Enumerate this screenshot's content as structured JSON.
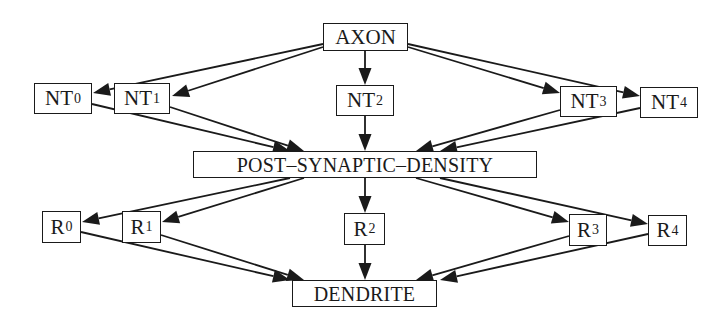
{
  "diagram": {
    "nodes": {
      "axon": {
        "label": "AXON",
        "x": 323,
        "y": 23,
        "w": 85,
        "h": 28
      },
      "nt0": {
        "label": "NT",
        "sub": "0",
        "x": 34,
        "y": 83,
        "w": 58,
        "h": 31
      },
      "nt1": {
        "label": "NT",
        "sub": "1",
        "x": 114,
        "y": 83,
        "w": 56,
        "h": 31
      },
      "nt2": {
        "label": "NT",
        "sub": "2",
        "x": 336,
        "y": 85,
        "w": 58,
        "h": 31
      },
      "nt3": {
        "label": "NT",
        "sub": "3",
        "x": 560,
        "y": 86,
        "w": 57,
        "h": 31
      },
      "nt4": {
        "label": "NT",
        "sub": "4",
        "x": 640,
        "y": 87,
        "w": 58,
        "h": 31
      },
      "psd": {
        "label": "POST–SYNAPTIC–DENSITY",
        "x": 193,
        "y": 151,
        "w": 344,
        "h": 27
      },
      "r0": {
        "label": "R",
        "sub": "0",
        "x": 42,
        "y": 211,
        "w": 39,
        "h": 32
      },
      "r1": {
        "label": "R",
        "sub": "1",
        "x": 122,
        "y": 211,
        "w": 39,
        "h": 32
      },
      "r2": {
        "label": "R",
        "sub": "2",
        "x": 344,
        "y": 213,
        "w": 41,
        "h": 32
      },
      "r3": {
        "label": "R",
        "sub": "3",
        "x": 569,
        "y": 214,
        "w": 38,
        "h": 32
      },
      "r4": {
        "label": "R",
        "sub": "4",
        "x": 648,
        "y": 215,
        "w": 39,
        "h": 31
      },
      "dendrite": {
        "label": "DENDRITE",
        "x": 292,
        "y": 280,
        "w": 145,
        "h": 27
      }
    },
    "edges": [
      {
        "from": "axon",
        "to": "nt0",
        "x1": 323,
        "y1": 44,
        "x2": 93,
        "y2": 93
      },
      {
        "from": "axon",
        "to": "nt1",
        "x1": 323,
        "y1": 47,
        "x2": 172,
        "y2": 96
      },
      {
        "from": "axon",
        "to": "nt2",
        "x1": 365,
        "y1": 51,
        "x2": 365,
        "y2": 85
      },
      {
        "from": "axon",
        "to": "nt3",
        "x1": 408,
        "y1": 47,
        "x2": 560,
        "y2": 93
      },
      {
        "from": "axon",
        "to": "nt4",
        "x1": 408,
        "y1": 44,
        "x2": 640,
        "y2": 96
      },
      {
        "from": "nt0",
        "to": "psd",
        "x1": 92,
        "y1": 104,
        "x2": 290,
        "y2": 151
      },
      {
        "from": "nt1",
        "to": "psd",
        "x1": 170,
        "y1": 107,
        "x2": 304,
        "y2": 151
      },
      {
        "from": "nt2",
        "to": "psd",
        "x1": 365,
        "y1": 116,
        "x2": 365,
        "y2": 151
      },
      {
        "from": "nt3",
        "to": "psd",
        "x1": 560,
        "y1": 110,
        "x2": 416,
        "y2": 151
      },
      {
        "from": "nt4",
        "to": "psd",
        "x1": 640,
        "y1": 108,
        "x2": 440,
        "y2": 151
      },
      {
        "from": "psd",
        "to": "r0",
        "x1": 290,
        "y1": 178,
        "x2": 82,
        "y2": 222
      },
      {
        "from": "psd",
        "to": "r1",
        "x1": 304,
        "y1": 178,
        "x2": 162,
        "y2": 222
      },
      {
        "from": "psd",
        "to": "r2",
        "x1": 365,
        "y1": 178,
        "x2": 365,
        "y2": 213
      },
      {
        "from": "psd",
        "to": "r3",
        "x1": 416,
        "y1": 178,
        "x2": 569,
        "y2": 222
      },
      {
        "from": "psd",
        "to": "r4",
        "x1": 440,
        "y1": 178,
        "x2": 648,
        "y2": 224
      },
      {
        "from": "r0",
        "to": "dendrite",
        "x1": 81,
        "y1": 232,
        "x2": 290,
        "y2": 280
      },
      {
        "from": "r1",
        "to": "dendrite",
        "x1": 161,
        "y1": 235,
        "x2": 304,
        "y2": 280
      },
      {
        "from": "r2",
        "to": "dendrite",
        "x1": 365,
        "y1": 245,
        "x2": 365,
        "y2": 280
      },
      {
        "from": "r3",
        "to": "dendrite",
        "x1": 569,
        "y1": 236,
        "x2": 416,
        "y2": 280
      },
      {
        "from": "r4",
        "to": "dendrite",
        "x1": 648,
        "y1": 234,
        "x2": 440,
        "y2": 280
      }
    ],
    "colors": {
      "stroke": "#1a1a1a",
      "background": "#ffffff"
    }
  }
}
